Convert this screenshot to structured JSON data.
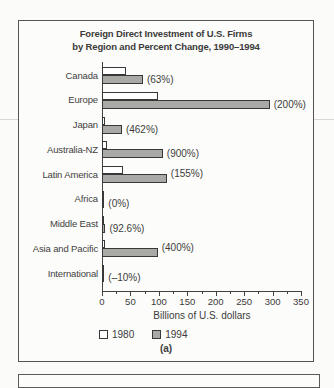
{
  "figure": {
    "title_line1": "Foreign Direct Investment of U.S. Firms",
    "title_line2": "by Region and Percent Change, 1990–1994",
    "panel_label": "(a)",
    "xlabel": "Billions of U.S. dollars",
    "legend": {
      "entry_1980": "1980",
      "entry_1994": "1994"
    }
  },
  "chart_data": {
    "type": "bar",
    "orientation": "horizontal",
    "title": "Foreign Direct Investment of U.S. Firms by Region and Percent Change, 1990–1994",
    "categories": [
      "Canada",
      "Europe",
      "Japan",
      "Australia-NZ",
      "Latin America",
      "Africa",
      "Middle East",
      "Asia and Pacific",
      "International"
    ],
    "series": [
      {
        "name": "1980",
        "color": "#ffffff",
        "values": [
          42,
          98,
          5,
          8,
          37,
          4,
          2.5,
          6,
          4
        ]
      },
      {
        "name": "1994",
        "color": "#a9a9a6",
        "values": [
          72,
          295,
          35,
          107,
          114,
          4,
          6,
          98,
          3.5
        ]
      }
    ],
    "percent_change": [
      "(63%)",
      "(200%)",
      "(462%)",
      "(900%)",
      "(155%)",
      "(0%)",
      "(92.6%)",
      "(400%)",
      "(–10%)"
    ],
    "xlabel": "Billions of U.S. dollars",
    "xlim": [
      0,
      350
    ],
    "x_major_ticks": [
      0,
      50,
      100,
      150,
      200,
      250,
      300,
      350
    ],
    "x_minor_ticks": [
      25,
      75,
      125,
      175,
      225,
      275,
      325
    ],
    "legend_position": "bottom",
    "grid": false
  },
  "colors": {
    "bar_1980": "#ffffff",
    "bar_1994": "#a9a9a6",
    "bar_border": "#383838",
    "axis": "#434343",
    "text": "#3b3b3b",
    "box_border": "#555451"
  }
}
